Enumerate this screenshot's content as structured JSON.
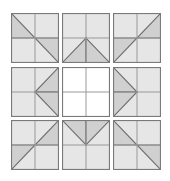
{
  "figure": {
    "name": "quilt-block-sampler",
    "rows": 3,
    "columns": 3,
    "background_color": "#ffffff",
    "block_fill_color": "#e6e6e6",
    "triangle_fill_color": "#d0d0d0",
    "block_outline_color": "#7a7a7a",
    "seam_line_color": "#999999",
    "triangle_edge_color": "#6e6e6e"
  },
  "blocks": [
    {
      "id": "block-r1c1",
      "row": 1,
      "column": 1,
      "name": "diagonal-chevron-block",
      "empty": false,
      "units": [
        {
          "quadrant": "top-left",
          "triangle": "lower-left"
        },
        {
          "quadrant": "top-right",
          "triangle": "none"
        },
        {
          "quadrant": "bottom-left",
          "triangle": "none"
        },
        {
          "quadrant": "bottom-right",
          "triangle": "upper-right"
        }
      ]
    },
    {
      "id": "block-r1c2",
      "row": 1,
      "column": 2,
      "name": "up-arrow-block",
      "empty": false,
      "units": [
        {
          "quadrant": "top-left",
          "triangle": "none"
        },
        {
          "quadrant": "top-right",
          "triangle": "none"
        },
        {
          "quadrant": "bottom-left",
          "triangle": "lower-right"
        },
        {
          "quadrant": "bottom-right",
          "triangle": "lower-left"
        }
      ]
    },
    {
      "id": "block-r1c3",
      "row": 1,
      "column": 3,
      "name": "mirrored-diagonal-chevron-block",
      "empty": false,
      "units": [
        {
          "quadrant": "top-left",
          "triangle": "none"
        },
        {
          "quadrant": "top-right",
          "triangle": "lower-right"
        },
        {
          "quadrant": "bottom-left",
          "triangle": "upper-left"
        },
        {
          "quadrant": "bottom-right",
          "triangle": "none"
        }
      ]
    },
    {
      "id": "block-r2c1",
      "row": 2,
      "column": 1,
      "name": "left-pointing-arrow-block",
      "empty": false,
      "units": [
        {
          "quadrant": "top-left",
          "triangle": "none"
        },
        {
          "quadrant": "top-right",
          "triangle": "lower-right"
        },
        {
          "quadrant": "bottom-left",
          "triangle": "none"
        },
        {
          "quadrant": "bottom-right",
          "triangle": "upper-right"
        }
      ]
    },
    {
      "id": "block-r2c2",
      "row": 2,
      "column": 2,
      "name": "empty-four-patch-block",
      "empty": true,
      "units": [
        {
          "quadrant": "top-left",
          "triangle": "none"
        },
        {
          "quadrant": "top-right",
          "triangle": "none"
        },
        {
          "quadrant": "bottom-left",
          "triangle": "none"
        },
        {
          "quadrant": "bottom-right",
          "triangle": "none"
        }
      ]
    },
    {
      "id": "block-r2c3",
      "row": 2,
      "column": 3,
      "name": "right-pointing-arrow-block",
      "empty": false,
      "units": [
        {
          "quadrant": "top-left",
          "triangle": "lower-left"
        },
        {
          "quadrant": "top-right",
          "triangle": "none"
        },
        {
          "quadrant": "bottom-left",
          "triangle": "upper-left"
        },
        {
          "quadrant": "bottom-right",
          "triangle": "none"
        }
      ]
    },
    {
      "id": "block-r3c1",
      "row": 3,
      "column": 1,
      "name": "reverse-diagonal-chevron-block",
      "empty": false,
      "units": [
        {
          "quadrant": "top-left",
          "triangle": "none"
        },
        {
          "quadrant": "top-right",
          "triangle": "lower-right"
        },
        {
          "quadrant": "bottom-left",
          "triangle": "upper-left"
        },
        {
          "quadrant": "bottom-right",
          "triangle": "none"
        }
      ]
    },
    {
      "id": "block-r3c2",
      "row": 3,
      "column": 2,
      "name": "down-arrow-block",
      "empty": false,
      "units": [
        {
          "quadrant": "top-left",
          "triangle": "upper-right"
        },
        {
          "quadrant": "top-right",
          "triangle": "upper-left"
        },
        {
          "quadrant": "bottom-left",
          "triangle": "none"
        },
        {
          "quadrant": "bottom-right",
          "triangle": "none"
        }
      ]
    },
    {
      "id": "block-r3c3",
      "row": 3,
      "column": 3,
      "name": "diagonal-chevron-block-repeat",
      "empty": false,
      "units": [
        {
          "quadrant": "top-left",
          "triangle": "lower-left"
        },
        {
          "quadrant": "top-right",
          "triangle": "none"
        },
        {
          "quadrant": "bottom-left",
          "triangle": "none"
        },
        {
          "quadrant": "bottom-right",
          "triangle": "upper-right"
        }
      ]
    }
  ]
}
